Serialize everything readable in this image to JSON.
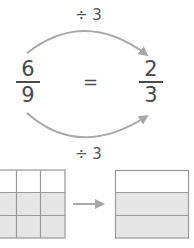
{
  "top_operation": {
    "label": "÷ 3"
  },
  "bottom_operation": {
    "label": "÷ 3"
  },
  "left_fraction": {
    "numerator": "6",
    "denominator": "9"
  },
  "equals": "=",
  "right_fraction": {
    "numerator": "2",
    "denominator": "3"
  },
  "left_grid": {
    "rows": 3,
    "cols": 3,
    "shaded_rows": [
      1,
      2
    ]
  },
  "right_grid": {
    "rows": 3,
    "cols": 1,
    "shaded_rows": [
      1,
      2
    ]
  },
  "colors": {
    "line": "#9a9a9a",
    "shade": "#e6e6e6",
    "text": "#4a4a4a",
    "arrow": "#a8a8a8"
  }
}
